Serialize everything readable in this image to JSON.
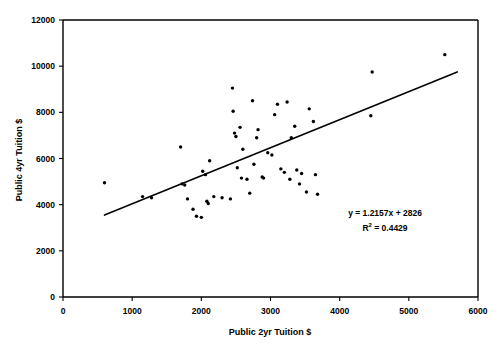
{
  "artifact": {
    "top_strip_text": "· · ·       ·       ·"
  },
  "chart_data": {
    "type": "scatter",
    "title": "",
    "subtitle": "",
    "xlabel": "Public 2yr Tuition $",
    "ylabel": "Public 4yr Tuition $",
    "xlim": [
      0,
      6000
    ],
    "ylim": [
      0,
      12000
    ],
    "xticks": [
      0,
      1000,
      2000,
      3000,
      4000,
      5000,
      6000
    ],
    "yticks": [
      0,
      2000,
      4000,
      6000,
      8000,
      10000,
      12000
    ],
    "xtick_labels": [
      "0",
      "1000",
      "2000",
      "3000",
      "4000",
      "5000",
      "6000"
    ],
    "ytick_labels": [
      "0",
      "2000",
      "4000",
      "6000",
      "8000",
      "10000",
      "12000"
    ],
    "grid": false,
    "legend": false,
    "legend_position": "none",
    "marker": "filled-circle",
    "marker_color": "#000000",
    "point_label": "state",
    "points": [
      [
        600,
        4950
      ],
      [
        1150,
        4350
      ],
      [
        1280,
        4300
      ],
      [
        1700,
        6500
      ],
      [
        1720,
        4900
      ],
      [
        1760,
        4850
      ],
      [
        1800,
        4250
      ],
      [
        1880,
        3800
      ],
      [
        1930,
        3500
      ],
      [
        2000,
        3450
      ],
      [
        2020,
        5450
      ],
      [
        2060,
        5300
      ],
      [
        2080,
        4150
      ],
      [
        2100,
        4050
      ],
      [
        2120,
        5900
      ],
      [
        2180,
        4350
      ],
      [
        2300,
        4300
      ],
      [
        2420,
        4250
      ],
      [
        2450,
        9050
      ],
      [
        2460,
        8050
      ],
      [
        2480,
        7100
      ],
      [
        2500,
        6950
      ],
      [
        2520,
        5600
      ],
      [
        2560,
        7350
      ],
      [
        2580,
        5150
      ],
      [
        2600,
        6400
      ],
      [
        2660,
        5100
      ],
      [
        2700,
        4500
      ],
      [
        2740,
        8500
      ],
      [
        2760,
        5750
      ],
      [
        2800,
        6900
      ],
      [
        2820,
        7250
      ],
      [
        2880,
        5200
      ],
      [
        2900,
        5150
      ],
      [
        2960,
        6250
      ],
      [
        3020,
        6150
      ],
      [
        3060,
        7900
      ],
      [
        3100,
        8350
      ],
      [
        3150,
        5550
      ],
      [
        3200,
        5400
      ],
      [
        3240,
        8450
      ],
      [
        3280,
        5100
      ],
      [
        3300,
        6900
      ],
      [
        3350,
        7400
      ],
      [
        3380,
        5500
      ],
      [
        3420,
        4900
      ],
      [
        3450,
        5350
      ],
      [
        3520,
        4550
      ],
      [
        3560,
        8150
      ],
      [
        3620,
        7600
      ],
      [
        3650,
        5300
      ],
      [
        3680,
        4450
      ],
      [
        4450,
        7850
      ],
      [
        4470,
        9750
      ],
      [
        5520,
        10500
      ]
    ],
    "trendline": {
      "equation_label": "y = 1.2157x + 2826",
      "r2_label_prefix": "R",
      "r2_label_sup": "2",
      "r2_label_suffix": " = 0.4429",
      "slope": 1.2157,
      "intercept": 2826,
      "r_squared": 0.4429,
      "x_start": 600,
      "x_end": 5700,
      "y_start": 3550,
      "y_end": 9750,
      "color": "#000000"
    }
  }
}
